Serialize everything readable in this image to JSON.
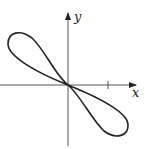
{
  "figure": {
    "axes": {
      "x_label": "x",
      "y_label": "y",
      "x_tick_count": 1
    },
    "colors": {
      "curve": "#222222",
      "axes": "#555555",
      "background": "#ffffff"
    }
  }
}
